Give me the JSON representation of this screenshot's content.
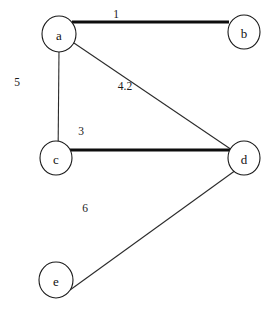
{
  "diagram": {
    "canvas": {
      "width": 275,
      "height": 310,
      "background": "#ffffff"
    },
    "colors": {
      "node_fill": "#ffffff",
      "node_stroke": "#1a1a1a",
      "edge_thin": "#2b2b2b",
      "edge_thick": "#0d0d0d",
      "label_text": "#111111"
    },
    "nodes": [
      {
        "id": "a",
        "label": "a",
        "cx": 59,
        "cy": 34,
        "rx": 17,
        "ry": 18
      },
      {
        "id": "b",
        "label": "b",
        "cx": 244,
        "cy": 32,
        "rx": 16,
        "ry": 17
      },
      {
        "id": "c",
        "label": "c",
        "cx": 56,
        "cy": 158,
        "rx": 16,
        "ry": 17
      },
      {
        "id": "d",
        "label": "d",
        "cx": 244,
        "cy": 158,
        "rx": 16,
        "ry": 17
      },
      {
        "id": "e",
        "label": "e",
        "cx": 56,
        "cy": 280,
        "rx": 17,
        "ry": 18
      }
    ],
    "edges": [
      {
        "id": "edge-a-b",
        "source": "a",
        "target": "b",
        "weight": "1",
        "style": "thick",
        "x1": 72,
        "y1": 22,
        "x2": 229,
        "y2": 22,
        "label_x": 116,
        "label_y": 14
      },
      {
        "id": "edge-a-c",
        "source": "a",
        "target": "c",
        "weight": "5",
        "style": "thin",
        "x1": 59,
        "y1": 50,
        "x2": 58,
        "y2": 160,
        "label_x": 17,
        "label_y": 82
      },
      {
        "id": "edge-a-d",
        "source": "a",
        "target": "d",
        "weight": "4.2",
        "style": "thin",
        "x1": 71,
        "y1": 41,
        "x2": 232,
        "y2": 150,
        "label_x": 125,
        "label_y": 86
      },
      {
        "id": "edge-c-d",
        "source": "c",
        "target": "d",
        "weight": "3",
        "style": "thick",
        "x1": 70,
        "y1": 150,
        "x2": 231,
        "y2": 150,
        "label_x": 81,
        "label_y": 131
      },
      {
        "id": "edge-e-d",
        "source": "e",
        "target": "d",
        "weight": "6",
        "style": "thin",
        "x1": 70,
        "y1": 290,
        "x2": 236,
        "y2": 170,
        "label_x": 85,
        "label_y": 208
      }
    ]
  }
}
